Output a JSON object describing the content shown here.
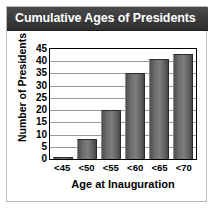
{
  "header": {
    "title": "Cumulative Ages of Presidents",
    "background_color": "#3d3d3d",
    "text_color": "#ffffff"
  },
  "chart_data": {
    "type": "bar",
    "title": "Cumulative Ages of Presidents",
    "categories": [
      "<45",
      "<50",
      "<55",
      "<60",
      "<65",
      "<70"
    ],
    "values": [
      1,
      8,
      20,
      35,
      41,
      43
    ],
    "xlabel": "Age at Inauguration",
    "ylabel": "Number of Presidents",
    "ylim": [
      0,
      45
    ],
    "ytick_step": 5,
    "yticks": [
      45,
      40,
      35,
      30,
      25,
      20,
      15,
      10,
      5,
      0
    ],
    "grid": true,
    "legend": "none",
    "bar_color": "#6e6e6e",
    "plot_border_color": "#000000",
    "gridline_color": "#9c9c9c",
    "background_color": "#ffffff"
  }
}
